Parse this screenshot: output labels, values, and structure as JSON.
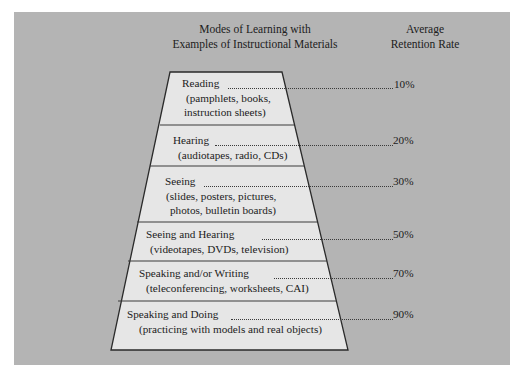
{
  "header": {
    "modes_line1": "Modes of Learning with",
    "modes_line2": "Examples of Instructional Materials",
    "rate_line1": "Average",
    "rate_line2": "Retention Rate"
  },
  "colors": {
    "panel": "#b4b4b4",
    "trapezoid_fill": "#e6e6e6",
    "outline": "#2a2a2a"
  },
  "levels": [
    {
      "mode": "Reading",
      "examples": [
        "(pamphlets, books,",
        "instruction sheets)"
      ],
      "rate": "10%"
    },
    {
      "mode": "Hearing",
      "examples": [
        "(audiotapes, radio, CDs)"
      ],
      "rate": "20%"
    },
    {
      "mode": "Seeing",
      "examples": [
        "(slides, posters, pictures,",
        "photos, bulletin boards)"
      ],
      "rate": "30%"
    },
    {
      "mode": "Seeing and Hearing",
      "examples": [
        "(videotapes, DVDs, television)"
      ],
      "rate": "50%"
    },
    {
      "mode": "Speaking and/or Writing",
      "examples": [
        "(teleconferencing, worksheets, CAI)"
      ],
      "rate": "70%"
    },
    {
      "mode": "Speaking and Doing",
      "examples": [
        "(practicing with models and real objects)"
      ],
      "rate": "90%"
    }
  ]
}
